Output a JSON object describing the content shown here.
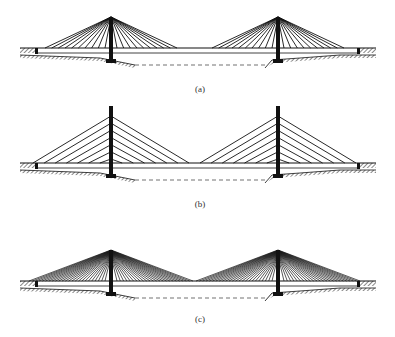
{
  "figure": {
    "panels": [
      {
        "id": "a",
        "label": "(a)",
        "cable_arrangement": "radial (fan)",
        "cables_per_side": 10
      },
      {
        "id": "b",
        "label": "(b)",
        "cable_arrangement": "harp (parallel)",
        "cables_per_side": 7
      },
      {
        "id": "c",
        "label": "(c)",
        "cable_arrangement": "dense fan",
        "cables_per_side": 24
      }
    ],
    "colors": {
      "line": "#111111",
      "background": "#ffffff"
    }
  }
}
